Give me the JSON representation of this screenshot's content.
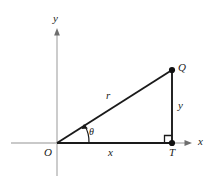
{
  "figure": {
    "kind": "right-triangle-polar-coordinates-diagram",
    "background_color": "#ffffff",
    "axis_color": "#b7b7b7",
    "line_color": "#1a1a1a",
    "label_color": "#1a1a1a"
  },
  "axes": {
    "x_axis_label": "x",
    "y_axis_label": "y",
    "origin_label": "O"
  },
  "points": {
    "origin": "O",
    "vertex_q": "Q",
    "foot_t": "T"
  },
  "segments": {
    "hypotenuse_label": "r",
    "vertical_leg_label": "y",
    "horizontal_leg_label": "x"
  },
  "angle": {
    "label": "θ",
    "marker": "arc-with-arrowhead"
  },
  "markers": {
    "right_angle": "right-angle-square"
  },
  "geometry": {
    "origin_xy": [
      57,
      143
    ],
    "t_xy": [
      172,
      143
    ],
    "q_xy": [
      172,
      70
    ],
    "x_axis_y": 143,
    "y_axis_x": 57,
    "x_axis_arrow_tip_x": 191,
    "y_axis_arrow_tip_y": 29
  }
}
